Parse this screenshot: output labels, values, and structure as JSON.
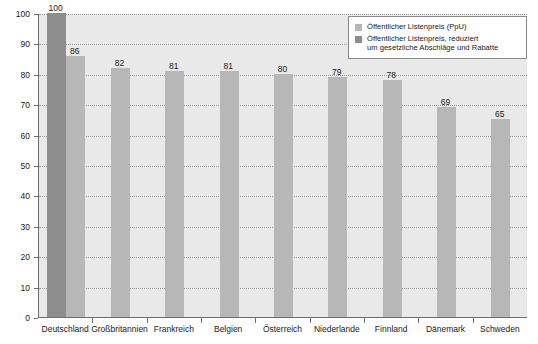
{
  "chart_data": {
    "type": "bar",
    "title": "",
    "subtitle": "",
    "xlabel": "",
    "ylabel": "",
    "ylim": [
      0,
      100
    ],
    "ytick_step": 10,
    "yticks": [
      0,
      10,
      20,
      30,
      40,
      50,
      60,
      70,
      80,
      90,
      100
    ],
    "grid": true,
    "grid_orientation": "horizontal",
    "legend_position": "top-right",
    "categories": [
      "Deutschland",
      "Großbritannien",
      "Frankreich",
      "Belgien",
      "Österreich",
      "Niederlande",
      "Finnland",
      "Dänemark",
      "Schweden"
    ],
    "series": [
      {
        "name": "Öffentlicher Listenpreis (PpU)",
        "color": "#b7b7b7",
        "values": [
          86,
          82,
          81,
          81,
          80,
          79,
          78,
          69,
          65
        ]
      },
      {
        "name": "Öffentlicher Listenpreis, reduziert um gesetzliche Abschläge und Rabatte",
        "color": "#8d8d8d",
        "values": [
          100,
          null,
          null,
          null,
          null,
          null,
          null,
          null,
          null
        ]
      }
    ],
    "bars": [
      {
        "category": "Deutschland",
        "value": 100,
        "label": "100",
        "series": "reduziert",
        "color": "#8d8d8d"
      },
      {
        "category": "Deutschland",
        "value": 86,
        "label": "86",
        "series": "listenpreis",
        "color": "#b7b7b7"
      },
      {
        "category": "Großbritannien",
        "value": 82,
        "label": "82",
        "series": "listenpreis",
        "color": "#b7b7b7"
      },
      {
        "category": "Frankreich",
        "value": 81,
        "label": "81",
        "series": "listenpreis",
        "color": "#b7b7b7"
      },
      {
        "category": "Belgien",
        "value": 81,
        "label": "81",
        "series": "listenpreis",
        "color": "#b7b7b7"
      },
      {
        "category": "Österreich",
        "value": 80,
        "label": "80",
        "series": "listenpreis",
        "color": "#b7b7b7"
      },
      {
        "category": "Niederlande",
        "value": 79,
        "label": "79",
        "series": "listenpreis",
        "color": "#b7b7b7"
      },
      {
        "category": "Finnland",
        "value": 78,
        "label": "78",
        "series": "listenpreis",
        "color": "#b7b7b7"
      },
      {
        "category": "Dänemark",
        "value": 69,
        "label": "69",
        "series": "listenpreis",
        "color": "#b7b7b7"
      },
      {
        "category": "Schweden",
        "value": 65,
        "label": "65",
        "series": "listenpreis",
        "color": "#b7b7b7"
      }
    ]
  },
  "legend": {
    "items": [
      {
        "swatch_color": "#b7b7b7",
        "lines": [
          "Öffentlicher Listenpreis (PpU)"
        ]
      },
      {
        "swatch_color": "#8d8d8d",
        "lines": [
          "Öffentlicher Listenpreis, reduziert",
          "um gesetzliche Abschläge und Rabatte"
        ]
      }
    ]
  },
  "colors": {
    "plot_background": "#e9e9e9",
    "axis": "#6e6e6e",
    "gridline": "#9a9a9a",
    "text": "#1a1a1a",
    "bar_light": "#b7b7b7",
    "bar_dark": "#8d8d8d",
    "legend_background": "#ffffff",
    "legend_border": "#8a8a8a"
  }
}
